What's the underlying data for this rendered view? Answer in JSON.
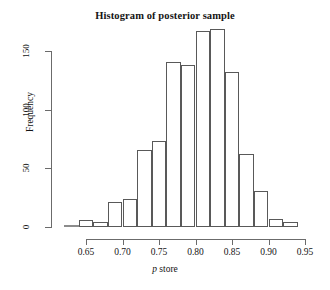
{
  "chart_data": {
    "type": "bar",
    "title": "Histogram of posterior sample",
    "xlabel": "p store",
    "xlabel_italic_part": "p",
    "xlabel_rest": " store",
    "ylabel": "Frequency",
    "xlim": [
      0.62,
      0.95
    ],
    "ylim": [
      0,
      176
    ],
    "grid": false,
    "legend": null,
    "bin_width": 0.02,
    "bin_edges": [
      0.62,
      0.64,
      0.66,
      0.68,
      0.7,
      0.72,
      0.74,
      0.76,
      0.78,
      0.8,
      0.82,
      0.84,
      0.86,
      0.88,
      0.9,
      0.92,
      0.94
    ],
    "categories": [
      "0.62-0.64",
      "0.64-0.66",
      "0.66-0.68",
      "0.68-0.70",
      "0.70-0.72",
      "0.72-0.74",
      "0.74-0.76",
      "0.76-0.78",
      "0.78-0.80",
      "0.80-0.82",
      "0.82-0.84",
      "0.84-0.86",
      "0.86-0.88",
      "0.88-0.90",
      "0.90-0.92",
      "0.92-0.94"
    ],
    "values": [
      1,
      6,
      4,
      21,
      24,
      66,
      73,
      141,
      138,
      167,
      169,
      132,
      62,
      31,
      7,
      4
    ],
    "xticks": [
      0.65,
      0.7,
      0.75,
      0.8,
      0.85,
      0.9,
      0.95
    ],
    "xtick_labels": [
      "0.65",
      "0.70",
      "0.75",
      "0.80",
      "0.85",
      "0.90",
      "0.95"
    ],
    "yticks": [
      0,
      50,
      100,
      150
    ],
    "ytick_labels": [
      "0",
      "50",
      "100",
      "150"
    ],
    "bar_edge_color": "#595959",
    "bar_fill_color": "#ffffff",
    "axis_color": "#6b6b6b",
    "text_color": "#141414",
    "background_color": "#ffffff"
  }
}
